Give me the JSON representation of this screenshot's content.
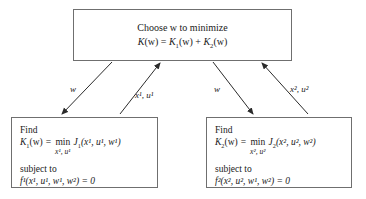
{
  "diagram": {
    "line_color": "#6f6f6f",
    "arrow_color": "#2b2b2b",
    "background": "#ffffff"
  },
  "top_box": {
    "line1": "Choose w to minimize",
    "line2_lhs": "K",
    "line2_lhs_arg": "(w)",
    "line2_eq": "=",
    "line2_t1_base": "K",
    "line2_t1_sub": "1",
    "line2_t1_arg": "(w)",
    "line2_plus": "+",
    "line2_t2_base": "K",
    "line2_t2_sub": "2",
    "line2_t2_arg": "(w)",
    "plain_text": "Choose w to minimize; K(w) = K1(w) + K2(w)"
  },
  "left_box": {
    "find_label": "Find",
    "lhs_base": "K",
    "lhs_sub": "1",
    "lhs_arg": "(w)",
    "eq": "=",
    "min_op": "min",
    "min_limits": "x¹, u¹",
    "obj_base": "J",
    "obj_sub": "1",
    "obj_args": "(x¹, u¹, w¹)",
    "subject_label": "subject to",
    "constraint": "f¹(x¹, u¹, w¹, w²) = 0",
    "plain_text": "Find K1(w) = min over x1,u1 of J1(x1,u1,w1) subject to f1(x1,u1,w1,w2) = 0"
  },
  "right_box": {
    "find_label": "Find",
    "lhs_base": "K",
    "lhs_sub": "2",
    "lhs_arg": "(w)",
    "eq": "=",
    "min_op": "min",
    "min_limits": "x², u²",
    "obj_base": "J",
    "obj_sub": "2",
    "obj_args": "(x², u², w²)",
    "subject_label": "subject to",
    "constraint": "f²(x², u², w¹, w²) = 0",
    "plain_text": "Find K2(w) = min over x2,u2 of J2(x2,u2,w2) subject to f2(x2,u2,w1,w2) = 0"
  },
  "edges": [
    {
      "id": "top-to-left",
      "label": "w",
      "direction": "down-left",
      "from": "top_box",
      "to": "left_box"
    },
    {
      "id": "left-to-top",
      "label": "x¹, u¹",
      "direction": "up-right",
      "from": "left_box",
      "to": "top_box"
    },
    {
      "id": "top-to-right",
      "label": "w",
      "direction": "down-right",
      "from": "top_box",
      "to": "right_box"
    },
    {
      "id": "right-to-top",
      "label": "x², u²",
      "direction": "up-left",
      "from": "right_box",
      "to": "top_box"
    }
  ]
}
